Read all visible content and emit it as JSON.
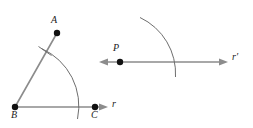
{
  "figure": {
    "name": "angle-copy-construction",
    "width": 253,
    "height": 128,
    "background_color": "#ffffff",
    "stroke_color": "#808080",
    "arc_color": "#666666",
    "point_color": "#111111",
    "label_color": "#1a1a1a"
  },
  "left_diagram": {
    "name": "original-angle",
    "points": [
      {
        "label": "A",
        "x": 57,
        "y": 33,
        "label_x": 51,
        "label_y": 18
      },
      {
        "label": "B",
        "x": 15,
        "y": 107,
        "label_x": 12,
        "label_y": 112
      },
      {
        "label": "C",
        "x": 95,
        "y": 107,
        "label_x": 92,
        "label_y": 112
      }
    ],
    "rays": [
      {
        "name": "ray-BA",
        "from": "B",
        "to": "A",
        "arrowhead": false
      },
      {
        "name": "ray-BC",
        "from": "B",
        "to": "C",
        "arrowhead": true,
        "label": "r",
        "label_x": 111,
        "label_y": 99
      }
    ],
    "arc": {
      "name": "construction-arc-left",
      "center": "B",
      "radius": 60,
      "start_x": 43,
      "start_y": 50,
      "end_x": 76,
      "end_y": 118
    },
    "tick": {
      "name": "tick-mark-on-ray-BA",
      "x1": 39,
      "y1": 48,
      "x2": 51,
      "y2": 56
    }
  },
  "right_diagram": {
    "name": "copied-ray",
    "points": [
      {
        "label": "P",
        "x": 120,
        "y": 62,
        "label_x": 114,
        "label_y": 46
      }
    ],
    "line": {
      "name": "line-r-prime",
      "x1": 100,
      "y1": 62,
      "x2": 228,
      "y2": 62,
      "arrow_left": true,
      "arrow_right": true,
      "label": "r′",
      "label_x": 232,
      "label_y": 53
    },
    "arc": {
      "name": "construction-arc-right",
      "center": "P",
      "radius": 60,
      "start_x": 140,
      "start_y": 18,
      "end_x": 175,
      "end_y": 76
    }
  }
}
